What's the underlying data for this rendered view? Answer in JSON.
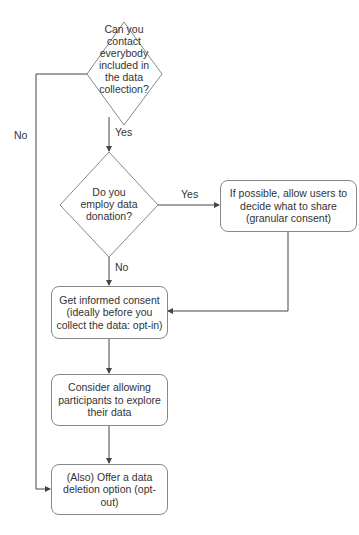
{
  "diagram": {
    "type": "flowchart",
    "nodes": {
      "q_contact": {
        "shape": "diamond",
        "lines": [
          "Can you",
          "contact",
          "everybody",
          "included in",
          "the data",
          "collection?"
        ]
      },
      "q_donation": {
        "shape": "diamond",
        "lines": [
          "Do you",
          "employ data",
          "donation?"
        ]
      },
      "granular": {
        "shape": "rounded-box",
        "text": "If possible, allow users to decide what to share (granular consent)"
      },
      "consent": {
        "shape": "rounded-box",
        "text": "Get informed consent (ideally before you collect the data: opt-in)"
      },
      "explore": {
        "shape": "rounded-box",
        "text": "Consider allowing participants to explore their data"
      },
      "deletion": {
        "shape": "rounded-box",
        "text": "(Also) Offer a data deletion option (opt-out)"
      }
    },
    "edges": [
      {
        "from": "q_contact",
        "to": "q_donation",
        "label": "Yes"
      },
      {
        "from": "q_contact",
        "to": "deletion",
        "label": "No"
      },
      {
        "from": "q_donation",
        "to": "granular",
        "label": "Yes"
      },
      {
        "from": "q_donation",
        "to": "consent",
        "label": "No"
      },
      {
        "from": "granular",
        "to": "consent",
        "label": ""
      },
      {
        "from": "consent",
        "to": "explore",
        "label": ""
      },
      {
        "from": "explore",
        "to": "deletion",
        "label": ""
      }
    ],
    "labels": {
      "yes1": "Yes",
      "no1": "No",
      "yes2": "Yes",
      "no2": "No"
    },
    "colors": {
      "stroke": "#888888",
      "line": "#444444",
      "text": "#333333",
      "background": "#ffffff"
    }
  }
}
